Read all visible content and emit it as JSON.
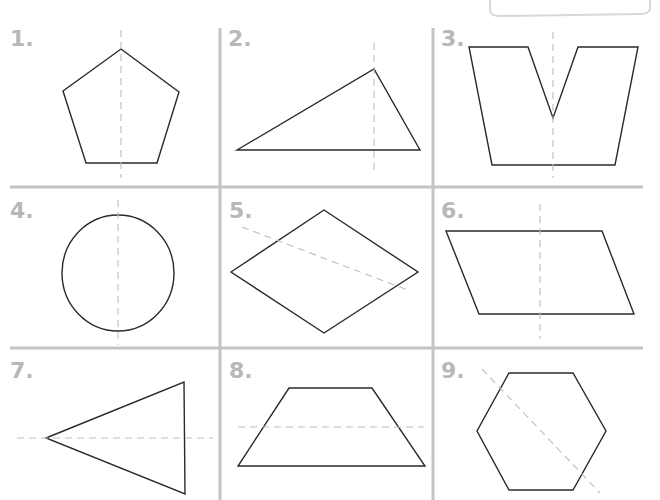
{
  "worksheet": {
    "topic": "Lines of symmetry",
    "colors": {
      "shape_stroke": "#2a2a2a",
      "symmetry_line": "#bdbdbd",
      "grid_line": "#c4c4c4",
      "number_label": "#b8b8b8",
      "background": "#ffffff"
    },
    "panels": [
      {
        "label": "1.",
        "shape": "pentagon",
        "symmetry_line": "vertical"
      },
      {
        "label": "2.",
        "shape": "scalene triangle",
        "symmetry_line": "vertical"
      },
      {
        "label": "3.",
        "shape": "V-notched trapezoid",
        "symmetry_line": "vertical"
      },
      {
        "label": "4.",
        "shape": "circle",
        "symmetry_line": "vertical"
      },
      {
        "label": "5.",
        "shape": "rhombus",
        "symmetry_line": "diagonal"
      },
      {
        "label": "6.",
        "shape": "parallelogram",
        "symmetry_line": "vertical"
      },
      {
        "label": "7.",
        "shape": "isosceles triangle",
        "symmetry_line": "horizontal"
      },
      {
        "label": "8.",
        "shape": "trapezoid",
        "symmetry_line": "horizontal"
      },
      {
        "label": "9.",
        "shape": "hexagon",
        "symmetry_line": "diagonal"
      }
    ]
  }
}
